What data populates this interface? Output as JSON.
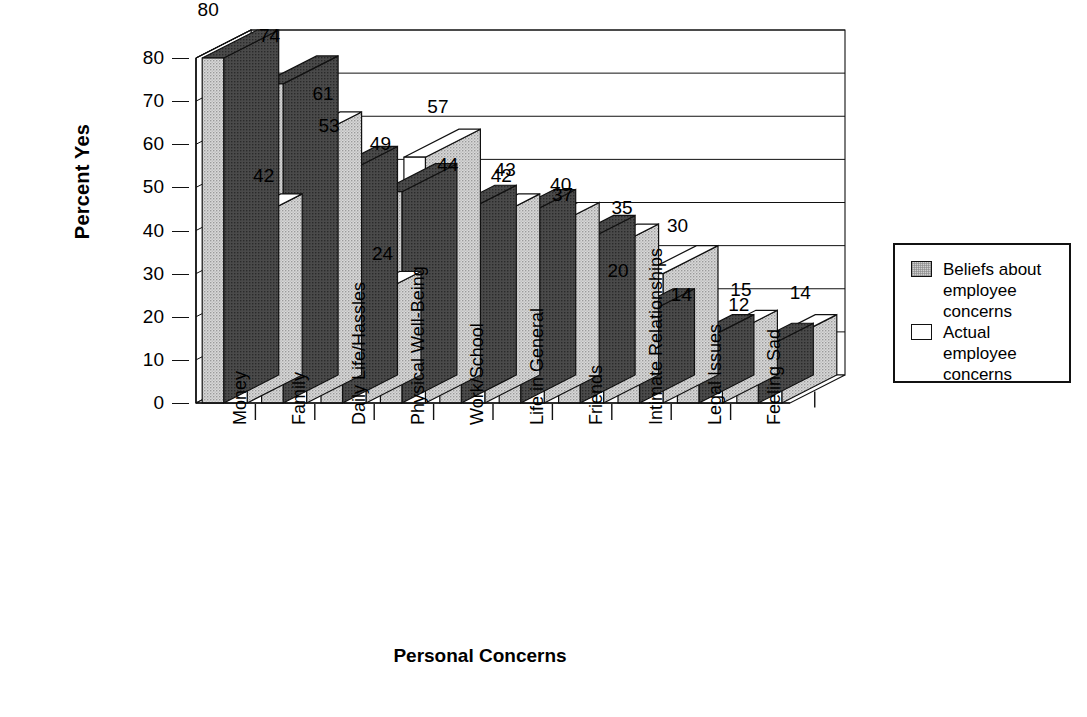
{
  "chart_data": {
    "type": "bar",
    "title": "",
    "subtitle": "",
    "xlabel": "Personal Concerns",
    "ylabel": "Percent Yes",
    "ylim": [
      0,
      80
    ],
    "yticks": [
      0,
      10,
      20,
      30,
      40,
      50,
      60,
      70,
      80
    ],
    "grid": true,
    "grid_axis": "y",
    "legend_position": "right",
    "three_d": true,
    "categories": [
      "Money",
      "Family",
      "Daily Life/Hassles",
      "Physical Well-Being",
      "Work/School",
      "Life in General",
      "Friends",
      "Intimate Relationships",
      "Legal Issues",
      "Feeling Sad"
    ],
    "series": [
      {
        "name": "Beliefs about employee concerns",
        "color": "#cfcfcf",
        "values": [
          80,
          74,
          53,
          49,
          44,
          43,
          37,
          20,
          14,
          12
        ]
      },
      {
        "name": "Actual employee concerns",
        "color": "#ffffff",
        "values": [
          42,
          61,
          24,
          57,
          42,
          40,
          35,
          30,
          15,
          14
        ]
      }
    ]
  },
  "legend": {
    "items": [
      {
        "label_lines": [
          "Beliefs about",
          "employee",
          "concerns"
        ],
        "swatch": "beliefs"
      },
      {
        "label_lines": [
          "Actual",
          "employee",
          "concerns"
        ],
        "swatch": "actual"
      }
    ],
    "item0_line0": "Beliefs about",
    "item0_line1": "employee",
    "item0_line2": "concerns",
    "item1_line0": "Actual",
    "item1_line1": "employee",
    "item1_line2": "concerns"
  },
  "axes": {
    "y_tick_labels": [
      "80",
      "70",
      "60",
      "50",
      "40",
      "30",
      "20",
      "10",
      "0"
    ],
    "y_title": "Percent Yes",
    "x_title": "Personal Concerns"
  },
  "value_labels": {
    "beliefs": [
      "80",
      "74",
      "53",
      "49",
      "44",
      "43",
      "37",
      "20",
      "14",
      "12"
    ],
    "actual": [
      "42",
      "61",
      "24",
      "57",
      "42",
      "40",
      "35",
      "30",
      "15",
      "14"
    ]
  }
}
